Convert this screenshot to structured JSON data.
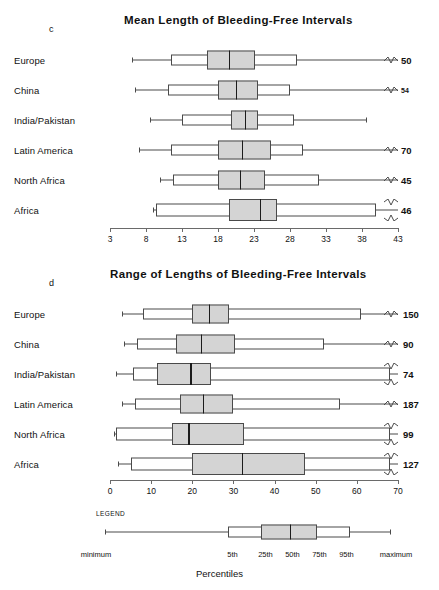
{
  "chart_data": [
    {
      "type": "box",
      "panel": "c",
      "title": "Mean Length of Bleeding-Free Intervals",
      "xlabel": "",
      "ylabel": "",
      "xlim": [
        3,
        43
      ],
      "ticks": [
        3,
        8,
        13,
        18,
        23,
        28,
        33,
        38,
        43
      ],
      "grid": false,
      "categories": [
        "Europe",
        "China",
        "India/Pakistan",
        "Latin America",
        "North Africa",
        "Africa"
      ],
      "boxes": [
        {
          "label": "Europe",
          "min": 6.0,
          "p5": 11.5,
          "p25": 16.5,
          "p50": 19.5,
          "p75": 23.2,
          "p95": 29.0,
          "max": 43.0,
          "n": "50",
          "break": "single"
        },
        {
          "label": "China",
          "min": 6.5,
          "p5": 11.0,
          "p25": 18.0,
          "p50": 20.5,
          "p75": 23.6,
          "p95": 28.0,
          "max": 43.0,
          "n": "54",
          "break": "single",
          "small_n": true
        },
        {
          "label": "India/Pakistan",
          "min": 8.5,
          "p5": 13.0,
          "p25": 19.8,
          "p50": 21.7,
          "p75": 23.6,
          "p95": 28.5,
          "max": 38.5,
          "n": "",
          "break": "none"
        },
        {
          "label": "Latin America",
          "min": 7.0,
          "p5": 11.5,
          "p25": 18.0,
          "p50": 21.3,
          "p75": 25.3,
          "p95": 29.8,
          "max": 43.0,
          "n": "70",
          "break": "single"
        },
        {
          "label": "North Africa",
          "min": 10.0,
          "p5": 11.8,
          "p25": 18.0,
          "p50": 21.0,
          "p75": 24.5,
          "p95": 32.0,
          "max": 43.0,
          "n": "45",
          "break": "single"
        },
        {
          "label": "Africa",
          "min": 9.0,
          "p5": 9.4,
          "p25": 19.5,
          "p50": 23.8,
          "p75": 26.2,
          "p95": 40.0,
          "max": 43.0,
          "n": "46",
          "break": "double"
        }
      ]
    },
    {
      "type": "box",
      "panel": "d",
      "title": "Range of Lengths of Bleeding-Free Intervals",
      "xlabel": "",
      "ylabel": "",
      "xlim": [
        0,
        70
      ],
      "ticks": [
        0,
        10,
        20,
        30,
        40,
        50,
        60,
        70
      ],
      "grid": false,
      "categories": [
        "Europe",
        "China",
        "India/Pakistan",
        "Latin America",
        "North Africa",
        "Africa"
      ],
      "boxes": [
        {
          "label": "Europe",
          "min": 3.0,
          "p5": 8.0,
          "p25": 20.0,
          "p50": 24.0,
          "p75": 29.0,
          "p95": 61.0,
          "max": 70.0,
          "n": "150",
          "break": "single"
        },
        {
          "label": "China",
          "min": 3.5,
          "p5": 6.5,
          "p25": 16.0,
          "p50": 22.0,
          "p75": 30.5,
          "p95": 52.0,
          "max": 70.0,
          "n": "90",
          "break": "single"
        },
        {
          "label": "India/Pakistan",
          "min": 1.5,
          "p5": 5.5,
          "p25": 11.5,
          "p50": 19.5,
          "p75": 24.5,
          "p95": 68.0,
          "max": 70.0,
          "n": "74",
          "break": "double"
        },
        {
          "label": "Latin America",
          "min": 3.0,
          "p5": 6.0,
          "p25": 17.0,
          "p50": 22.5,
          "p75": 30.0,
          "p95": 56.0,
          "max": 70.0,
          "n": "187",
          "break": "single"
        },
        {
          "label": "North Africa",
          "min": 1.0,
          "p5": 1.4,
          "p25": 15.0,
          "p50": 19.0,
          "p75": 32.5,
          "p95": 68.0,
          "max": 70.0,
          "n": "99",
          "break": "double"
        },
        {
          "label": "Africa",
          "min": 2.0,
          "p5": 5.0,
          "p25": 20.0,
          "p50": 32.0,
          "p75": 47.5,
          "p95": 68.0,
          "max": 70.0,
          "n": "127",
          "break": "double"
        }
      ]
    }
  ],
  "panels": {
    "c": {
      "letter": "c",
      "title": "Mean Length of Bleeding-Free Intervals"
    },
    "d": {
      "letter": "d",
      "title": "Range of Lengths of Bleeding-Free Intervals"
    }
  },
  "legend": {
    "heading": "LEGEND",
    "axis_title": "Percentiles",
    "marks": [
      {
        "label": "minimum",
        "pos": 0.0
      },
      {
        "label": "5th",
        "pos": 0.455
      },
      {
        "label": "25th",
        "pos": 0.565
      },
      {
        "label": "50th",
        "pos": 0.655
      },
      {
        "label": "75th",
        "pos": 0.745
      },
      {
        "label": "95th",
        "pos": 0.835
      },
      {
        "label": "maximum",
        "pos": 1.0
      }
    ],
    "box": {
      "min": 0.03,
      "p5": 0.44,
      "p25": 0.55,
      "p50": 0.645,
      "p75": 0.735,
      "p95": 0.845,
      "max": 0.98
    }
  },
  "colors": {
    "box_fill": "#d4d4d4",
    "box_outline": "#4a4a4a",
    "median": "#1b1b1b",
    "axis": "#6a6a6a",
    "background": "#ffffff"
  }
}
